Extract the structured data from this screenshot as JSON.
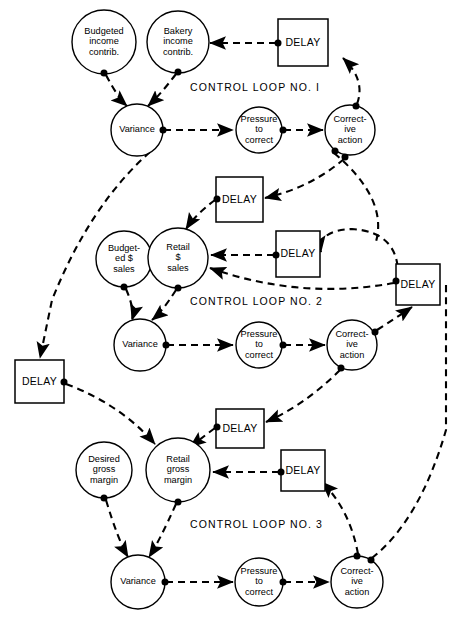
{
  "diagram": {
    "colors": {
      "ink": "#000000",
      "paper": "#ffffff"
    },
    "loop_labels": [
      {
        "id": "loop1",
        "text": "CONTROL LOOP NO. I",
        "x": 190,
        "y": 88
      },
      {
        "id": "loop2",
        "text": "CONTROL LOOP NO. 2",
        "x": 190,
        "y": 302
      },
      {
        "id": "loop3",
        "text": "CONTROL LOOP NO. 3",
        "x": 190,
        "y": 525
      }
    ],
    "nodes": [
      {
        "id": "budgeted-income-contrib",
        "shape": "circle",
        "cx": 104,
        "cy": 42,
        "r": 32,
        "lines": [
          "Budgeted",
          "income",
          "contrib."
        ]
      },
      {
        "id": "bakery-income-contrib",
        "shape": "circle",
        "cx": 178,
        "cy": 42,
        "r": 31,
        "lines": [
          "Bakery",
          "income",
          "contrib."
        ]
      },
      {
        "id": "variance-1",
        "shape": "circle",
        "cx": 137,
        "cy": 130,
        "r": 26,
        "lines": [
          "Variance"
        ]
      },
      {
        "id": "pressure-to-correct-1",
        "shape": "circle",
        "cx": 259,
        "cy": 130,
        "r": 23,
        "lines": [
          "Pressure",
          "to",
          "correct"
        ]
      },
      {
        "id": "corrective-action-1",
        "shape": "circle",
        "cx": 350,
        "cy": 130,
        "r": 25,
        "lines": [
          "Correct-",
          "ive",
          "action"
        ]
      },
      {
        "id": "budgeted-dollar-sales",
        "shape": "circle",
        "cx": 124,
        "cy": 259,
        "r": 28,
        "lines": [
          "Budget-",
          "ed  $",
          "sales"
        ]
      },
      {
        "id": "retail-dollar-sales",
        "shape": "circle",
        "cx": 178,
        "cy": 258,
        "r": 30,
        "lines": [
          "Retail",
          "$",
          "sales"
        ]
      },
      {
        "id": "variance-2",
        "shape": "circle",
        "cx": 140,
        "cy": 345,
        "r": 26,
        "lines": [
          "Variance"
        ]
      },
      {
        "id": "pressure-to-correct-2",
        "shape": "circle",
        "cx": 259,
        "cy": 345,
        "r": 23,
        "lines": [
          "Pressure",
          "to",
          "correct"
        ]
      },
      {
        "id": "corrective-action-2",
        "shape": "circle",
        "cx": 352,
        "cy": 345,
        "r": 25,
        "lines": [
          "Correct-",
          "ive",
          "action"
        ]
      },
      {
        "id": "desired-gross-margin",
        "shape": "circle",
        "cx": 104,
        "cy": 470,
        "r": 28,
        "lines": [
          "Desired",
          "gross",
          "margin"
        ]
      },
      {
        "id": "retail-gross-margin",
        "shape": "circle",
        "cx": 178,
        "cy": 470,
        "r": 32,
        "lines": [
          "Retail",
          "gross",
          "margin"
        ]
      },
      {
        "id": "variance-3",
        "shape": "circle",
        "cx": 138,
        "cy": 582,
        "r": 27,
        "lines": [
          "Variance"
        ]
      },
      {
        "id": "pressure-to-correct-3",
        "shape": "circle",
        "cx": 259,
        "cy": 582,
        "r": 24,
        "lines": [
          "Pressure",
          "to",
          "correct"
        ]
      },
      {
        "id": "corrective-action-3",
        "shape": "circle",
        "cx": 357,
        "cy": 582,
        "r": 26,
        "lines": [
          "Correct-",
          "ive",
          "action"
        ]
      }
    ],
    "delay_boxes": [
      {
        "id": "delay-1",
        "label": "DELAY",
        "x": 278,
        "y": 19,
        "w": 50,
        "h": 47
      },
      {
        "id": "delay-2",
        "label": "DELAY",
        "x": 216,
        "y": 177,
        "w": 47,
        "h": 45
      },
      {
        "id": "delay-3",
        "label": "DELAY",
        "x": 276,
        "y": 231,
        "w": 44,
        "h": 46
      },
      {
        "id": "delay-4",
        "label": "DELAY",
        "x": 396,
        "y": 264,
        "w": 44,
        "h": 41
      },
      {
        "id": "delay-5",
        "label": "DELAY",
        "x": 15,
        "y": 360,
        "w": 49,
        "h": 43
      },
      {
        "id": "delay-6",
        "label": "DELAY",
        "x": 216,
        "y": 409,
        "w": 48,
        "h": 39
      },
      {
        "id": "delay-7",
        "label": "DELAY",
        "x": 281,
        "y": 450,
        "w": 44,
        "h": 41
      }
    ],
    "junction_dots": [
      {
        "id": "dot-budgeted-income-out",
        "x": 104,
        "y": 73
      },
      {
        "id": "dot-bakery-income-out",
        "x": 178,
        "y": 72
      },
      {
        "id": "dot-delay1-out",
        "x": 278,
        "y": 43
      },
      {
        "id": "dot-variance1-out",
        "x": 163,
        "y": 130
      },
      {
        "id": "dot-pressure1-out",
        "x": 283,
        "y": 130
      },
      {
        "id": "dot-corrective1-top",
        "x": 356,
        "y": 106
      },
      {
        "id": "dot-corrective1-lower-a",
        "x": 335,
        "y": 151
      },
      {
        "id": "dot-corrective1-lower-b",
        "x": 345,
        "y": 157
      },
      {
        "id": "dot-delay2-in",
        "x": 217,
        "y": 199
      },
      {
        "id": "dot-budgeted-sales-out",
        "x": 124,
        "y": 287
      },
      {
        "id": "dot-retail-sales-out",
        "x": 178,
        "y": 288
      },
      {
        "id": "dot-delay3-out",
        "x": 276,
        "y": 255
      },
      {
        "id": "dot-delay4-out",
        "x": 396,
        "y": 281
      },
      {
        "id": "dot-variance2-out",
        "x": 166,
        "y": 345
      },
      {
        "id": "dot-pressure2-out",
        "x": 283,
        "y": 345
      },
      {
        "id": "dot-corrective2-right",
        "x": 375,
        "y": 332
      },
      {
        "id": "dot-corrective2-lower",
        "x": 341,
        "y": 368
      },
      {
        "id": "dot-delay5-out",
        "x": 64,
        "y": 382
      },
      {
        "id": "dot-delay6-out",
        "x": 217,
        "y": 427
      },
      {
        "id": "dot-delay7-out",
        "x": 281,
        "y": 472
      },
      {
        "id": "dot-desired-margin-out",
        "x": 104,
        "y": 498
      },
      {
        "id": "dot-retail-margin-out",
        "x": 178,
        "y": 502
      },
      {
        "id": "dot-variance3-out",
        "x": 165,
        "y": 582
      },
      {
        "id": "dot-pressure3-out",
        "x": 283,
        "y": 582
      },
      {
        "id": "dot-corrective3-top",
        "x": 357,
        "y": 556
      },
      {
        "id": "dot-corrective3-right",
        "x": 371,
        "y": 560
      }
    ],
    "edges": [
      {
        "id": "delay1-to-bakery",
        "d": "M 276 43 L 210 43",
        "arrow": true
      },
      {
        "id": "budgeted-income-to-variance",
        "d": "M 106 75 Q 118 98 127 106",
        "arrow": true
      },
      {
        "id": "bakery-income-to-variance",
        "d": "M 176 74 Q 160 95 148 106",
        "arrow": true
      },
      {
        "id": "variance1-to-pressure",
        "d": "M 164 130 L 233 130",
        "arrow": true
      },
      {
        "id": "pressure1-to-corrective",
        "d": "M 284 130 L 323 130",
        "arrow": true
      },
      {
        "id": "corrective1-to-delay1",
        "d": "M 357 104 Q 366 80 343 58",
        "arrow": true
      },
      {
        "id": "corrective1-to-delay2",
        "d": "M 344 159 Q 310 188 265 198",
        "arrow": true
      },
      {
        "id": "corrective1-to-retail-sales",
        "d": "M 334 153 Q 390 200 375 245",
        "arrow": false
      },
      {
        "id": "variance1-to-left-delay",
        "d": "M 150 152 Q 90 205 52 300 L 40 358",
        "arrow": true
      },
      {
        "id": "delay2-to-retail-sales",
        "d": "M 215 200 Q 195 215 186 229",
        "arrow": true
      },
      {
        "id": "delay3-to-retail-sales",
        "d": "M 274 255 L 211 255",
        "arrow": true
      },
      {
        "id": "delay4-curve-to-delay3",
        "d": "M 398 278 Q 400 232 352 229 Q 318 230 321 252",
        "arrow": true
      },
      {
        "id": "delay4-to-retail-sales",
        "d": "M 394 283 Q 300 300 210 268",
        "arrow": true
      },
      {
        "id": "budgeted-sales-to-variance2",
        "d": "M 126 289 Q 135 310 132 320",
        "arrow": true
      },
      {
        "id": "retail-sales-to-variance2",
        "d": "M 176 290 Q 162 312 152 320",
        "arrow": true
      },
      {
        "id": "variance2-to-pressure2",
        "d": "M 167 345 L 233 345",
        "arrow": true
      },
      {
        "id": "pressure2-to-corrective2",
        "d": "M 284 345 L 325 345",
        "arrow": true
      },
      {
        "id": "corrective2-to-delay4",
        "d": "M 377 330 Q 396 318 412 307",
        "arrow": true
      },
      {
        "id": "corrective2-to-delay6",
        "d": "M 340 370 Q 305 405 266 422",
        "arrow": true
      },
      {
        "id": "delay5-to-retail-margin",
        "d": "M 66 384 Q 120 404 155 444",
        "arrow": true
      },
      {
        "id": "delay6-to-retail-margin",
        "d": "M 215 428 Q 199 440 190 447",
        "arrow": true
      },
      {
        "id": "delay7-to-retail-margin",
        "d": "M 279 472 L 213 472",
        "arrow": true
      },
      {
        "id": "desired-margin-to-variance3",
        "d": "M 106 500 Q 118 540 128 557",
        "arrow": true
      },
      {
        "id": "retail-margin-to-variance3",
        "d": "M 176 504 Q 160 540 149 557",
        "arrow": true
      },
      {
        "id": "variance3-to-pressure3",
        "d": "M 166 582 L 233 582",
        "arrow": true
      },
      {
        "id": "pressure3-to-corrective3",
        "d": "M 284 582 L 329 582",
        "arrow": true
      },
      {
        "id": "corrective3-to-delay7",
        "d": "M 358 554 Q 350 510 322 482",
        "arrow": true
      },
      {
        "id": "corrective3-to-right-column",
        "d": "M 372 558 Q 420 520 446 430 L 446 290",
        "arrow": false
      },
      {
        "id": "right-column-to-delay4",
        "d": "M 446 290 L 446 285",
        "arrow": false
      }
    ],
    "arrowhead": {
      "width": 9,
      "length": 11
    }
  }
}
